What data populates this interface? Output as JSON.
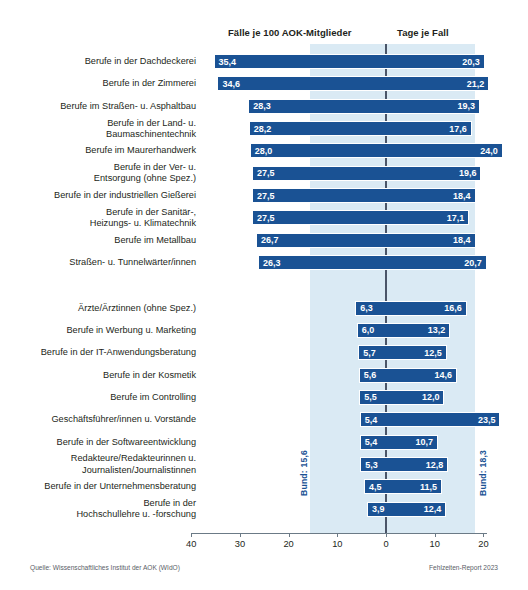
{
  "header": {
    "left_column_title": "Fälle je 100 AOK-Mitglieder",
    "right_column_title": "Tage je Fall"
  },
  "footer": {
    "source": "Quelle: Wissenschaftliches Institut der AOK (WIdO)",
    "report": "Fehlzeiten-Report 2023"
  },
  "reference": {
    "left_label": "Bund: 15,6",
    "right_label": "Bund: 18,3",
    "left_value": 15.6,
    "right_value": 18.3
  },
  "axis": {
    "ticks": [
      "40",
      "30",
      "20",
      "10",
      "0",
      "10",
      "20"
    ],
    "tick_values": [
      40,
      30,
      20,
      10,
      0,
      10,
      20
    ]
  },
  "chart_data": {
    "type": "bar",
    "orientation": "horizontal-diverging",
    "title": "",
    "subtitle": "",
    "xlabel": "",
    "ylabel": "",
    "grid": false,
    "legend_position": "top",
    "left_axis_title": "Fälle je 100 AOK-Mitglieder",
    "right_axis_title": "Tage je Fall",
    "left_axis_range": [
      40,
      0
    ],
    "right_axis_range": [
      0,
      20
    ],
    "reference_lines": {
      "faelle_bund": 15.6,
      "tage_bund": 18.3
    },
    "categories": [
      "Berufe in der Dachdeckerei",
      "Berufe in der Zimmerei",
      "Berufe im Straßen- u. Asphaltbau",
      "Berufe in der Land- u.\nBaumaschinentechnik",
      "Berufe im Maurerhandwerk",
      "Berufe in der Ver- u.\nEntsorgung (ohne Spez.)",
      "Berufe in der industriellen Gießerei",
      "Berufe in der Sanitär-,\nHeizungs- u. Klimatechnik",
      "Berufe im Metallbau",
      "Straßen- u. Tunnelwärter/innen",
      "Ärzte/Ärztinnen (ohne Spez.)",
      "Berufe in Werbung u. Marketing",
      "Berufe in der IT-Anwendungsberatung",
      "Berufe in der Kosmetik",
      "Berufe im Controlling",
      "Geschäftsführer/innen u. Vorstände",
      "Berufe in der Softwareentwicklung",
      "Redakteure/Redakteurinnen u.\nJournalisten/Journalistinnen",
      "Berufe in der Unternehmensberatung",
      "Berufe in der\nHochschullehre u. -forschung"
    ],
    "series": [
      {
        "name": "Fälle je 100 AOK-Mitglieder",
        "side": "left",
        "values": [
          35.4,
          34.6,
          28.3,
          28.2,
          28.0,
          27.5,
          27.5,
          27.5,
          26.7,
          26.3,
          6.3,
          6.0,
          5.7,
          5.6,
          5.5,
          5.4,
          5.4,
          5.3,
          4.5,
          3.9
        ],
        "labels": [
          "35,4",
          "34,6",
          "28,3",
          "28,2",
          "28,0",
          "27,5",
          "27,5",
          "27,5",
          "26,7",
          "26,3",
          "6,3",
          "6,0",
          "5,7",
          "5,6",
          "5,5",
          "5,4",
          "5,4",
          "5,3",
          "4,5",
          "3,9"
        ]
      },
      {
        "name": "Tage je Fall",
        "side": "right",
        "values": [
          20.3,
          21.2,
          19.3,
          17.6,
          24.0,
          19.6,
          18.4,
          17.1,
          18.4,
          20.7,
          16.6,
          13.2,
          12.5,
          14.6,
          12.0,
          23.5,
          10.7,
          12.8,
          11.5,
          12.4
        ],
        "labels": [
          "20,3",
          "21,2",
          "19,3",
          "17,6",
          "24,0",
          "19,6",
          "18,4",
          "17,1",
          "18,4",
          "20,7",
          "16,6",
          "13,2",
          "12,5",
          "14,6",
          "12,0",
          "23,5",
          "10,7",
          "12,8",
          "11,5",
          "12,4"
        ]
      }
    ],
    "group_gap_after_index": 9,
    "colors": {
      "bar": "#1a5294",
      "band": "#daeaf4",
      "zero_line": "#4a5568",
      "text": "#231f20"
    }
  }
}
